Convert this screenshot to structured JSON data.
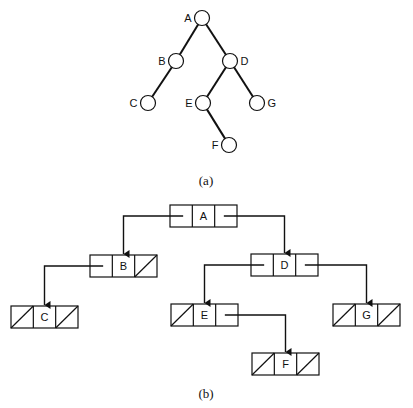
{
  "figure_a": {
    "caption": "(a)",
    "nodes": [
      {
        "id": "A",
        "label": "A",
        "cx": 202,
        "cy": 18,
        "label_side": "left"
      },
      {
        "id": "B",
        "label": "B",
        "cx": 176,
        "cy": 61,
        "label_side": "left"
      },
      {
        "id": "D",
        "label": "D",
        "cx": 230,
        "cy": 61,
        "label_side": "right"
      },
      {
        "id": "C",
        "label": "C",
        "cx": 148,
        "cy": 103,
        "label_side": "left"
      },
      {
        "id": "E",
        "label": "E",
        "cx": 203,
        "cy": 103,
        "label_side": "left"
      },
      {
        "id": "G",
        "label": "G",
        "cx": 257,
        "cy": 103,
        "label_side": "right"
      },
      {
        "id": "F",
        "label": "F",
        "cx": 229,
        "cy": 145,
        "label_side": "left"
      }
    ],
    "edges": [
      [
        "A",
        "B"
      ],
      [
        "A",
        "D"
      ],
      [
        "B",
        "C"
      ],
      [
        "D",
        "E"
      ],
      [
        "D",
        "G"
      ],
      [
        "E",
        "F"
      ]
    ]
  },
  "figure_b": {
    "caption": "(b)",
    "nodes": [
      {
        "id": "A",
        "label": "A",
        "x": 170,
        "y": 205,
        "left_null": false,
        "right_null": false
      },
      {
        "id": "B",
        "label": "B",
        "x": 90,
        "y": 255,
        "left_null": false,
        "right_null": true
      },
      {
        "id": "D",
        "label": "D",
        "x": 251,
        "y": 254,
        "left_null": false,
        "right_null": false
      },
      {
        "id": "C",
        "label": "C",
        "x": 11,
        "y": 306,
        "left_null": true,
        "right_null": true
      },
      {
        "id": "E",
        "label": "E",
        "x": 171,
        "y": 304,
        "left_null": true,
        "right_null": false
      },
      {
        "id": "G",
        "label": "G",
        "x": 333,
        "y": 304,
        "left_null": true,
        "right_null": true
      },
      {
        "id": "F",
        "label": "F",
        "x": 252,
        "y": 353,
        "left_null": true,
        "right_null": true
      }
    ],
    "links": [
      {
        "from": "A",
        "side": "left",
        "to": "B"
      },
      {
        "from": "A",
        "side": "right",
        "to": "D"
      },
      {
        "from": "B",
        "side": "left",
        "to": "C"
      },
      {
        "from": "D",
        "side": "left",
        "to": "E"
      },
      {
        "from": "D",
        "side": "right",
        "to": "G"
      },
      {
        "from": "E",
        "side": "right",
        "to": "F"
      }
    ]
  }
}
